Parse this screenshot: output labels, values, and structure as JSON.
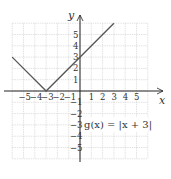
{
  "chart_data": {
    "type": "line",
    "title": "",
    "xlabel": "x",
    "ylabel": "y",
    "xlim": [
      -6,
      6
    ],
    "ylim": [
      -6,
      6
    ],
    "grid": true,
    "x_ticks": [
      "-5",
      "-4",
      "-3",
      "-2",
      "-1",
      "1",
      "2",
      "3",
      "4",
      "5"
    ],
    "y_ticks": [
      "5",
      "4",
      "3",
      "2",
      "1",
      "-1",
      "-2",
      "-3",
      "-4",
      "-5"
    ],
    "series": [
      {
        "name": "g(x) = |x + 3|",
        "x": [
          -6,
          -3,
          3
        ],
        "y": [
          3,
          0,
          6
        ]
      }
    ],
    "annotation": "g(x) = |x + 3|"
  },
  "labels": {
    "x_axis": "x",
    "y_axis": "y",
    "function": "g(x) = |x + 3|"
  },
  "colors": {
    "grid": "#d0d0d0",
    "axis": "#222222",
    "line": "#555555"
  }
}
